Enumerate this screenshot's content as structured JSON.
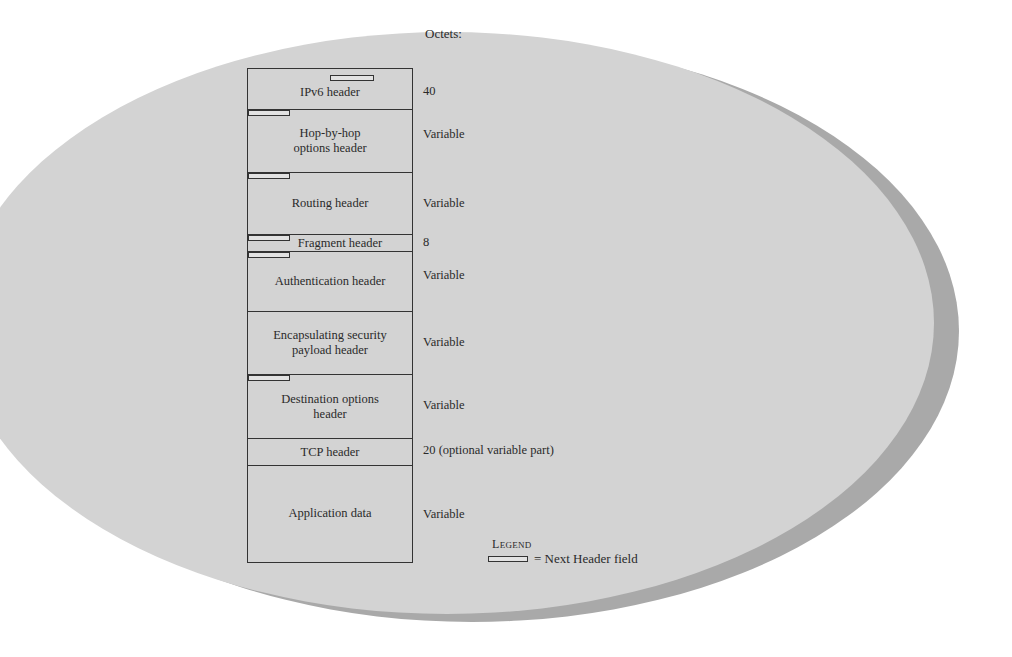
{
  "diagram": {
    "octets_heading": "Octets:",
    "segments": [
      {
        "label": "IPv6 header",
        "size": "40"
      },
      {
        "label": "Hop-by-hop options header",
        "line1": "Hop-by-hop",
        "line2": "options header",
        "size": "Variable"
      },
      {
        "label": "Routing header",
        "size": "Variable"
      },
      {
        "label": "Fragment header",
        "size": "8"
      },
      {
        "label": "Authentication header",
        "size": "Variable"
      },
      {
        "label": "Encapsulating security payload header",
        "line1": "Encapsulating security",
        "line2": "payload header",
        "size": "Variable"
      },
      {
        "label": "Destination options header",
        "line1": "Destination options",
        "line2": "header",
        "size": "Variable"
      },
      {
        "label": "TCP header",
        "size": "20 (optional variable part)"
      },
      {
        "label": "Application data",
        "size": "Variable"
      }
    ],
    "legend": {
      "title_first": "L",
      "title_rest": "EGEND",
      "entry": "= Next Header field"
    },
    "colors": {
      "ellipse_fill": "#d3d3d3",
      "ellipse_shadow": "#a9a9a9",
      "line": "#333333"
    }
  }
}
